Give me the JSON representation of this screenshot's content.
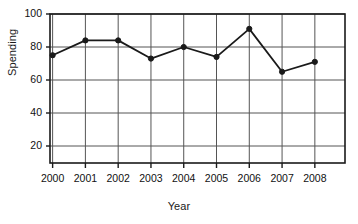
{
  "chart_data": {
    "type": "line",
    "title": "",
    "xlabel": "Year",
    "ylabel": "Spending",
    "categories": [
      "2000",
      "2001",
      "2002",
      "2003",
      "2004",
      "2005",
      "2006",
      "2007",
      "2008"
    ],
    "x": [
      2000,
      2001,
      2002,
      2003,
      2004,
      2005,
      2006,
      2007,
      2008
    ],
    "values": [
      75,
      84,
      84,
      73,
      80,
      74,
      91,
      65,
      71
    ],
    "series": [
      {
        "name": "Spending",
        "values": [
          75,
          84,
          84,
          73,
          80,
          74,
          91,
          65,
          71
        ]
      }
    ],
    "ylim": [
      0,
      100
    ],
    "yticks": [
      20,
      40,
      60,
      80,
      100
    ],
    "ytick_labels": [
      "20",
      "40",
      "60",
      "80",
      "100"
    ],
    "xtick_labels": [
      "2000",
      "2001",
      "2002",
      "2003",
      "2004",
      "2005",
      "2006",
      "2007",
      "2008"
    ],
    "grid": true,
    "grid_axis": "both",
    "legend": "none",
    "marker": "filled-circle",
    "line_color": "#1a1a1a",
    "marker_color": "#1a1a1a",
    "grid_color": "#555555",
    "frame_color": "#1a1a1a",
    "background": "#ffffff"
  },
  "axes": {
    "y_title": "Spending",
    "x_title": "Year"
  },
  "ticks": {
    "y": [
      "100",
      "80",
      "60",
      "40",
      "20"
    ],
    "x": [
      "2000",
      "2001",
      "2002",
      "2003",
      "2004",
      "2005",
      "2006",
      "2007",
      "2008"
    ]
  }
}
